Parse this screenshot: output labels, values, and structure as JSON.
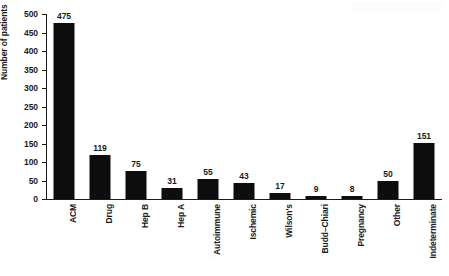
{
  "chart_data": {
    "type": "bar",
    "title": "",
    "xlabel": "",
    "ylabel": "Number of patients",
    "ylim": [
      0,
      500
    ],
    "yticks": [
      0,
      50,
      100,
      150,
      200,
      250,
      300,
      350,
      400,
      450,
      500
    ],
    "grid": false,
    "legend": null,
    "bar_color": "#0d0d0d",
    "axis_color": "#1a1a1a",
    "background": "#ffffff",
    "value_labels_shown": true,
    "categories": [
      "ACM",
      "Drug",
      "Hep B",
      "Hep A",
      "Autoimmune",
      "Ischemic",
      "Wilson's",
      "Budd–Chiari",
      "Pregnancy",
      "Other",
      "Indeterminate"
    ],
    "values": [
      475,
      119,
      75,
      31,
      55,
      43,
      17,
      9,
      8,
      50,
      151
    ],
    "value_label_text": [
      "475",
      "119",
      "75",
      "31",
      "55",
      "43",
      "17",
      "9",
      "8",
      "50",
      "151"
    ]
  }
}
